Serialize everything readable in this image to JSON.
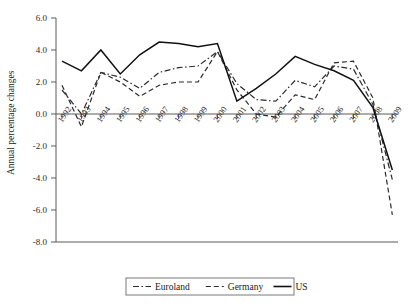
{
  "chart_data": {
    "type": "line",
    "title": "",
    "xlabel": "",
    "ylabel": "Annual percentage changes",
    "ylim": [
      -8.0,
      6.0
    ],
    "grid": false,
    "legend_position": "bottom",
    "categories": [
      "1992",
      "1993",
      "1994",
      "1995",
      "1996",
      "1997",
      "1998",
      "1999",
      "2000",
      "2001",
      "2002",
      "2003",
      "2004",
      "2005",
      "2006",
      "2007",
      "2008",
      "2009"
    ],
    "y_ticks": [
      "6.0",
      "4.0",
      "2.0",
      "0.0",
      "-2.0",
      "-4.0",
      "-6.0",
      "-8.0"
    ],
    "y_tick_values": [
      6.0,
      4.0,
      2.0,
      0.0,
      -2.0,
      -4.0,
      -6.0,
      -8.0
    ],
    "series": [
      {
        "name": "Euroland",
        "style": "dash-dot",
        "color": "#2b2b2b",
        "values": [
          1.5,
          0.0,
          2.6,
          2.3,
          1.6,
          2.6,
          2.9,
          3.0,
          3.9,
          1.9,
          0.9,
          0.8,
          2.1,
          1.7,
          3.0,
          2.8,
          0.6,
          -4.1
        ]
      },
      {
        "name": "Germany",
        "style": "dashed",
        "color": "#2b2b2b",
        "values": [
          1.8,
          -0.8,
          2.6,
          2.0,
          1.1,
          1.8,
          2.0,
          2.0,
          3.9,
          1.5,
          0.0,
          -0.2,
          1.2,
          0.9,
          3.2,
          3.3,
          1.0,
          -6.3
        ]
      },
      {
        "name": "US",
        "style": "solid",
        "color": "#111111",
        "values": [
          3.3,
          2.7,
          4.0,
          2.5,
          3.7,
          4.5,
          4.4,
          4.2,
          4.4,
          0.8,
          1.6,
          2.5,
          3.6,
          3.1,
          2.7,
          2.1,
          0.4,
          -3.5
        ]
      }
    ]
  },
  "legend": {
    "items": [
      {
        "label": "Euroland",
        "style": "dash-dot"
      },
      {
        "label": "Germany",
        "style": "dashed"
      },
      {
        "label": "US",
        "style": "solid"
      }
    ]
  },
  "axes": {
    "y_title": "Annual percentage changes"
  }
}
